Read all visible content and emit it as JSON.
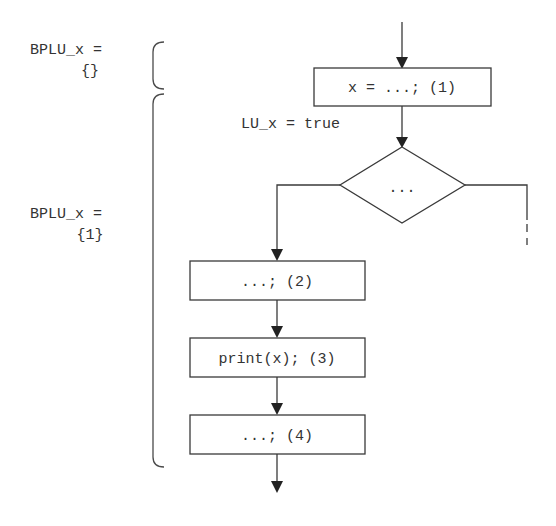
{
  "annotations": {
    "bplu_before": {
      "line1": "BPLU_x =",
      "line2": "{}"
    },
    "bplu_after": {
      "line1": "BPLU_x =",
      "line2": "{1}"
    },
    "lu_label": "LU_x = true"
  },
  "nodes": [
    {
      "id": "1",
      "type": "statement",
      "label": "x = ...; (1)"
    },
    {
      "id": "cond",
      "type": "decision",
      "label": "..."
    },
    {
      "id": "2",
      "type": "statement",
      "label": "...; (2)"
    },
    {
      "id": "3",
      "type": "statement",
      "label": "print(x); (3)"
    },
    {
      "id": "4",
      "type": "statement",
      "label": "...; (4)"
    }
  ],
  "edges": [
    {
      "from": "entry",
      "to": "1"
    },
    {
      "from": "1",
      "to": "cond"
    },
    {
      "from": "cond",
      "to": "2",
      "branch": "left"
    },
    {
      "from": "cond",
      "to": "continues",
      "branch": "right",
      "style": "dashed"
    },
    {
      "from": "2",
      "to": "3"
    },
    {
      "from": "3",
      "to": "4"
    },
    {
      "from": "4",
      "to": "exit"
    }
  ],
  "colors": {
    "stroke": "#3a3a3a",
    "text": "#333333",
    "background": "#ffffff"
  }
}
